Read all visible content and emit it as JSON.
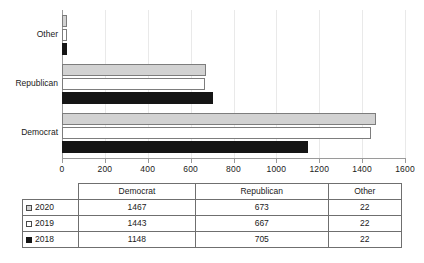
{
  "chart_data": {
    "type": "bar",
    "orientation": "horizontal",
    "title": "",
    "xlabel": "",
    "ylabel": "",
    "categories": [
      "Democrat",
      "Republican",
      "Other"
    ],
    "plot_category_order_top_to_bottom": [
      "Other",
      "Republican",
      "Democrat"
    ],
    "series": [
      {
        "name": "2020",
        "values": [
          1467,
          673,
          22
        ],
        "color": "#d2d2d2",
        "marker": "gray-square"
      },
      {
        "name": "2019",
        "values": [
          1443,
          667,
          22
        ],
        "color": "#ffffff",
        "marker": "white-square"
      },
      {
        "name": "2018",
        "values": [
          1148,
          705,
          22
        ],
        "color": "#151515",
        "marker": "black-square"
      }
    ],
    "xlim": [
      0,
      1600
    ],
    "xticks": [
      0,
      200,
      400,
      600,
      800,
      1000,
      1200,
      1400,
      1600
    ],
    "xtick_labels": [
      "0",
      "200",
      "400",
      "600",
      "800",
      "1000",
      "1200",
      "1400",
      "1600"
    ],
    "grid": "vertical",
    "legend_position": "table-row-headers",
    "gridline_color": "#e9e9e9",
    "axis_color": "#9a9a9a"
  },
  "table": {
    "corner_label": "",
    "column_headers": [
      "Democrat",
      "Republican",
      "Other"
    ],
    "rows": [
      {
        "label": "2020",
        "marker": "gray-square",
        "values": [
          "1467",
          "673",
          "22"
        ]
      },
      {
        "label": "2019",
        "marker": "white-square",
        "values": [
          "1443",
          "667",
          "22"
        ]
      },
      {
        "label": "2018",
        "marker": "black-square",
        "values": [
          "1148",
          "705",
          "22"
        ]
      }
    ]
  }
}
